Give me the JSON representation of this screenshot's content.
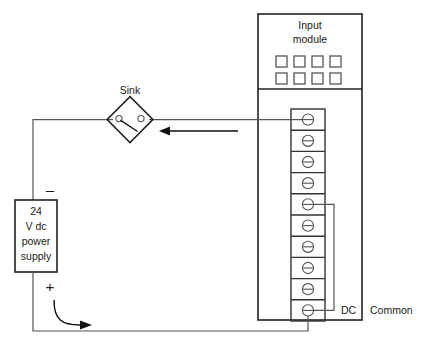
{
  "diagram": {
    "title_visible": false,
    "type": "plc-dc-sinking-input-wiring",
    "module": {
      "header_line1": "Input",
      "header_line2": "module",
      "led_count": 8,
      "led_rows": 2,
      "led_cols": 4
    },
    "terminal_strip": {
      "terminal_count": 10,
      "symbol": "screw-terminal-circle-slot"
    },
    "sensor": {
      "label": "Sink",
      "symbol": "switch-in-diamond"
    },
    "power_supply": {
      "line1": "24",
      "line2": "V dc",
      "line3": "power",
      "line4": "supply",
      "negative_sign": "–",
      "positive_sign": "+"
    },
    "annotations": {
      "dc": "DC",
      "common": "Common"
    },
    "colors": {
      "background": "#ffffff",
      "box_stroke": "#222222",
      "wire_stroke": "#555555",
      "text": "#1a1a1a",
      "arrow": "#111111"
    },
    "current_arrows": [
      {
        "name": "return-path-arrow",
        "direction": "left"
      },
      {
        "name": "supply-path-arrow",
        "direction": "right"
      }
    ]
  }
}
